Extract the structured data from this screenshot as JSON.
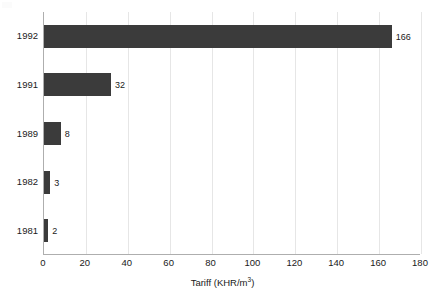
{
  "chart_data": {
    "type": "bar",
    "orientation": "horizontal",
    "title": "",
    "subtitle": "",
    "xlabel": "Tariff (KHR/m3)",
    "xlabel_base": "Tariff (KHR/m",
    "xlabel_sup": "3",
    "xlabel_tail": ")",
    "ylabel": "",
    "categories": [
      "1992",
      "1991",
      "1989",
      "1982",
      "1981"
    ],
    "values": [
      166,
      32,
      8,
      3,
      2
    ],
    "value_labels": [
      "166",
      "32",
      "8",
      "3",
      "2"
    ],
    "xlim": [
      0,
      180
    ],
    "xticks": [
      0,
      20,
      40,
      60,
      80,
      100,
      120,
      140,
      160,
      180
    ],
    "xtick_labels": [
      "0",
      "20",
      "40",
      "60",
      "80",
      "100",
      "120",
      "140",
      "160",
      "180"
    ],
    "grid": {
      "vertical": true,
      "horizontal": false,
      "color": "#e6e6e6"
    },
    "legend": {
      "visible": false,
      "entries": []
    },
    "series": [
      {
        "name": "Tariff",
        "color": "#3b3b3b",
        "values": [
          166,
          32,
          8,
          3,
          2
        ]
      }
    ]
  },
  "colors": {
    "bar": "#3b3b3b",
    "grid": "#e6e6e6",
    "axis": "#aeaeae",
    "text": "#1a1a1a",
    "background": "#ffffff"
  }
}
